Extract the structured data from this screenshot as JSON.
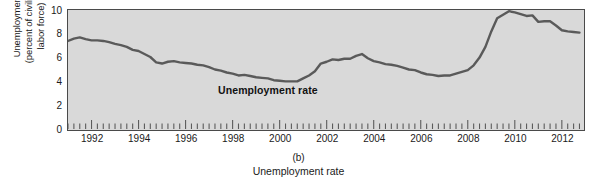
{
  "figure": {
    "panel_id": "(b)",
    "caption": "Unemployment rate",
    "series_label": "Unemployment rate",
    "plot_bg_color": "#d9d9d9",
    "line_color": "#5a5a5a",
    "axis_color": "#4a4a4a"
  },
  "axis": {
    "ylabel_line1": "Unemployment",
    "ylabel_line2": "(percent of civilian",
    "ylabel_line3": "labor force)",
    "yticks": [
      "0",
      "2",
      "4",
      "6",
      "8",
      "10"
    ],
    "xticks": [
      "1992",
      "1994",
      "1996",
      "1998",
      "2000",
      "2002",
      "2004",
      "2006",
      "2008",
      "2010",
      "2012"
    ]
  },
  "chart_data": {
    "type": "line",
    "title": "",
    "subtitle": "",
    "xlabel": "Unemployment rate",
    "ylabel": "Unemployment (percent of civilian labor force)",
    "xlim": [
      1991.0,
      2012.9
    ],
    "ylim": [
      0,
      10
    ],
    "grid": false,
    "legend": "inline-series-label",
    "legend_position": "inside-center-left",
    "annotations": [
      {
        "text": "Unemployment rate",
        "x": 1998.6,
        "y": 2.9,
        "bold": true
      }
    ],
    "ytick_values": [
      0,
      2,
      4,
      6,
      8,
      10
    ],
    "xtick_values": [
      1992,
      1994,
      1996,
      1998,
      2000,
      2002,
      2004,
      2006,
      2008,
      2010,
      2012
    ],
    "xtick_minor_interval_years": 0.25,
    "series": [
      {
        "name": "Unemployment rate",
        "units": "percent of civilian labor force",
        "x": [
          1991.0,
          1991.25,
          1991.5,
          1991.75,
          1992.0,
          1992.25,
          1992.5,
          1992.75,
          1993.0,
          1993.25,
          1993.5,
          1993.75,
          1994.0,
          1994.25,
          1994.5,
          1994.75,
          1995.0,
          1995.25,
          1995.5,
          1995.75,
          1996.0,
          1996.25,
          1996.5,
          1996.75,
          1997.0,
          1997.25,
          1997.5,
          1997.75,
          1998.0,
          1998.25,
          1998.5,
          1998.75,
          1999.0,
          1999.25,
          1999.5,
          1999.75,
          2000.0,
          2000.25,
          2000.5,
          2000.75,
          2001.0,
          2001.25,
          2001.5,
          2001.75,
          2002.0,
          2002.25,
          2002.5,
          2002.75,
          2003.0,
          2003.25,
          2003.5,
          2003.75,
          2004.0,
          2004.25,
          2004.5,
          2004.75,
          2005.0,
          2005.25,
          2005.5,
          2005.75,
          2006.0,
          2006.25,
          2006.5,
          2006.75,
          2007.0,
          2007.25,
          2007.5,
          2007.75,
          2008.0,
          2008.25,
          2008.5,
          2008.75,
          2009.0,
          2009.25,
          2009.5,
          2009.75,
          2010.0,
          2010.25,
          2010.5,
          2010.75,
          2011.0,
          2011.25,
          2011.5,
          2011.75,
          2012.0,
          2012.25,
          2012.5,
          2012.75
        ],
        "values": [
          7.4,
          7.6,
          7.7,
          7.55,
          7.45,
          7.45,
          7.4,
          7.3,
          7.15,
          7.05,
          6.9,
          6.65,
          6.55,
          6.3,
          6.05,
          5.6,
          5.5,
          5.65,
          5.7,
          5.6,
          5.55,
          5.5,
          5.4,
          5.35,
          5.2,
          5.0,
          4.9,
          4.75,
          4.65,
          4.5,
          4.55,
          4.45,
          4.35,
          4.3,
          4.25,
          4.1,
          4.05,
          4.0,
          4.0,
          4.0,
          4.25,
          4.5,
          4.85,
          5.5,
          5.65,
          5.85,
          5.8,
          5.9,
          5.9,
          6.15,
          6.3,
          5.95,
          5.7,
          5.6,
          5.45,
          5.4,
          5.3,
          5.15,
          5.0,
          4.95,
          4.75,
          4.6,
          4.55,
          4.45,
          4.5,
          4.5,
          4.65,
          4.8,
          4.95,
          5.35,
          6.0,
          6.9,
          8.2,
          9.3,
          9.6,
          9.9,
          9.8,
          9.65,
          9.5,
          9.55,
          9.0,
          9.05,
          9.05,
          8.7,
          8.3,
          8.2,
          8.15,
          8.1
        ]
      }
    ]
  }
}
